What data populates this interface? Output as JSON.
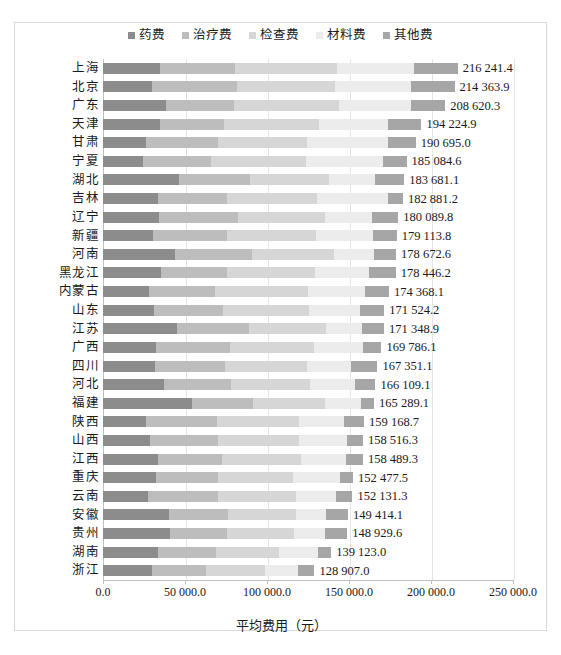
{
  "chart_data": {
    "type": "bar",
    "orientation": "horizontal",
    "stacked": true,
    "title": "",
    "xlabel": "平均费用（元）",
    "ylabel": "",
    "xlim": [
      0,
      250000
    ],
    "xticks": [
      "0.0",
      "50 000.0",
      "100 000.0",
      "150 000.0",
      "200 000.0",
      "250 000.0"
    ],
    "xtick_values": [
      0,
      50000,
      100000,
      150000,
      200000,
      250000
    ],
    "grid": true,
    "legend_position": "top-center",
    "legend": [
      "药费",
      "治疗费",
      "检查费",
      "材料费",
      "其他费"
    ],
    "colors": [
      "#8c8c8c",
      "#bdbdbd",
      "#d6d6d6",
      "#ececec",
      "#a6a6a6"
    ],
    "categories": [
      "上海",
      "北京",
      "广东",
      "天津",
      "甘肃",
      "宁夏",
      "湖北",
      "吉林",
      "辽宁",
      "新疆",
      "河南",
      "黑龙江",
      "内蒙古",
      "山东",
      "江苏",
      "广西",
      "四川",
      "河北",
      "福建",
      "陕西",
      "山西",
      "江西",
      "重庆",
      "云南",
      "安徽",
      "贵州",
      "湖南",
      "浙江"
    ],
    "totals": [
      216241.4,
      214363.9,
      208620.3,
      194224.9,
      190695.0,
      185084.6,
      183681.1,
      182881.2,
      180089.8,
      179113.8,
      178672.6,
      178446.2,
      174368.1,
      171524.2,
      171348.9,
      169786.1,
      167351.1,
      166109.1,
      165289.1,
      159168.7,
      158516.3,
      158489.3,
      152477.5,
      152131.3,
      149414.1,
      148929.6,
      139123.0,
      128907.0
    ],
    "total_labels": [
      "216 241.4",
      "214 363.9",
      "208 620.3",
      "194 224.9",
      "190 695.0",
      "185 084.6",
      "183 681.1",
      "182 881.2",
      "180 089.8",
      "179 113.8",
      "178 672.6",
      "178 446.2",
      "174 368.1",
      "171 524.2",
      "171 348.9",
      "169 786.1",
      "167 351.1",
      "166 109.1",
      "165 289.1",
      "159 168.7",
      "158 516.3",
      "158 489.3",
      "152 477.5",
      "152 131.3",
      "149 414.1",
      "148 929.6",
      "139 123.0",
      "128 907.0"
    ],
    "series": [
      {
        "name": "药费",
        "values": [
          34500,
          29800,
          38600,
          34900,
          26200,
          24600,
          46500,
          33800,
          34300,
          30700,
          43900,
          35500,
          28100,
          31300,
          45300,
          32500,
          31800,
          37200,
          54300,
          26500,
          28600,
          33400,
          32100,
          27300,
          40500,
          40900,
          33600,
          29600
        ]
      },
      {
        "name": "治疗费",
        "values": [
          45800,
          52100,
          41500,
          38700,
          43900,
          41200,
          42900,
          41600,
          48200,
          44800,
          47100,
          40300,
          40500,
          41800,
          43600,
          45100,
          42300,
          40700,
          37100,
          43200,
          41700,
          38900,
          38200,
          42600,
          35800,
          34700,
          35600,
          33100
        ]
      },
      {
        "name": "检查费",
        "values": [
          62400,
          59300,
          63700,
          58100,
          54300,
          57800,
          48700,
          55200,
          52900,
          54600,
          49800,
          53400,
          56300,
          52700,
          46800,
          51200,
          50600,
          48300,
          44200,
          50100,
          49300,
          48600,
          45700,
          47500,
          41600,
          40800,
          38200,
          35900
        ]
      },
      {
        "name": "材料费",
        "values": [
          47200,
          46800,
          44300,
          42100,
          49700,
          46900,
          27800,
          43100,
          28900,
          34500,
          24600,
          33100,
          34900,
          31200,
          22400,
          29700,
          26800,
          27500,
          21800,
          26900,
          29100,
          27300,
          28400,
          24600,
          18300,
          19100,
          23500,
          20400
        ]
      },
      {
        "name": "其他费",
        "values": [
          26341,
          26364,
          20520,
          20425,
          16595,
          14585,
          17781,
          9181,
          15790,
          14514,
          13273,
          16146,
          14568,
          14524,
          13249,
          11286,
          15851,
          12409,
          7889,
          12469,
          9816,
          10289,
          8078,
          10131,
          13214,
          13430,
          8223,
          9907
        ]
      }
    ]
  }
}
